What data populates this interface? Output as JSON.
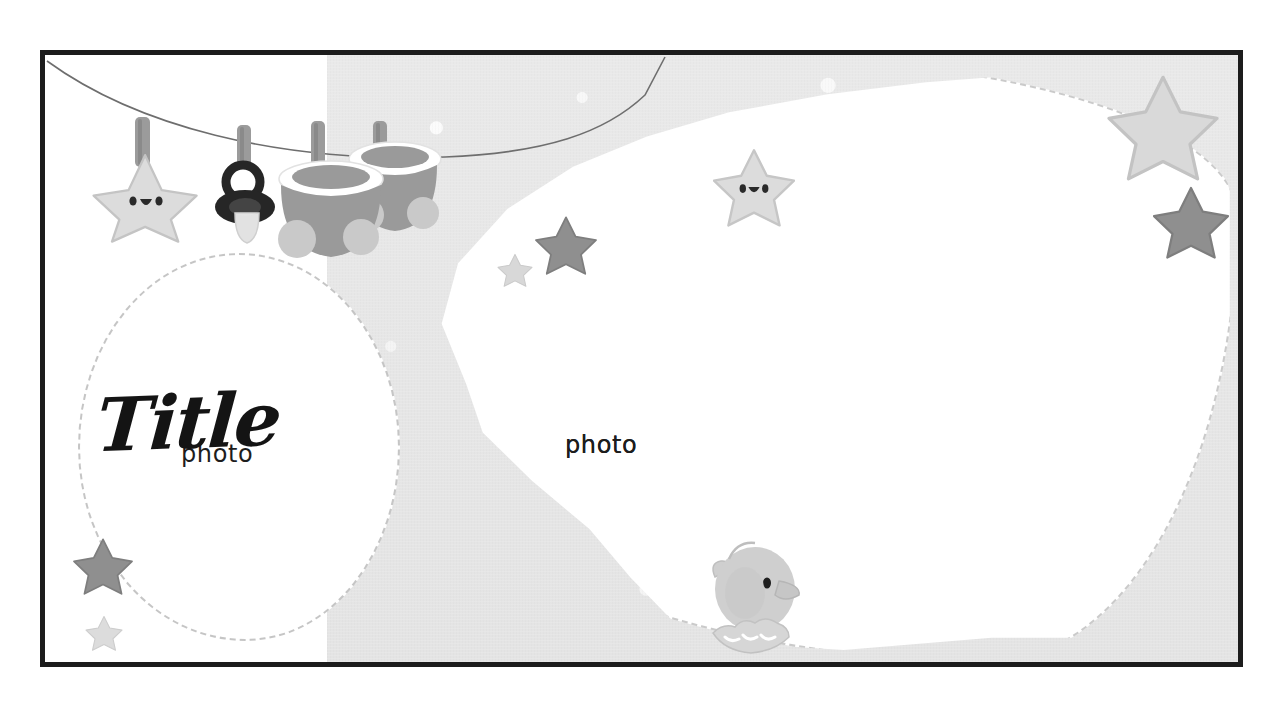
{
  "page": {
    "kind": "scrapbook-photo-collage-template",
    "theme": "baby",
    "title": "Title"
  },
  "colors": {
    "frame_border": "#1c1c1c",
    "panel_white": "#ffffff",
    "panel_grey": "#e7e7e7",
    "photo_fill": "#ffffff",
    "star_dark": "#8f8f8f",
    "star_mid": "#b4b4b4",
    "star_light": "#dedede",
    "bootie_grey": "#9a9a9a",
    "bootie_light": "#c9c9c9",
    "pacifier_dark": "#2b2b2b",
    "clothespin": "#9b9b9b",
    "line_color": "#6e6e6e",
    "text_color": "#1d1d1d",
    "duck_body": "#cfcfcf"
  },
  "photos": [
    {
      "id": "photo-1",
      "label": "photo",
      "shape": "circle"
    },
    {
      "id": "photo-2",
      "label": "photo",
      "shape": "organic-blob"
    },
    {
      "id": "photo-3",
      "label": "photo",
      "shape": "organic-blob"
    }
  ],
  "decorations": {
    "clothesline": {
      "name": "clothesline-string"
    },
    "hanging_items": [
      {
        "name": "star-plush-toy",
        "has_face": true
      },
      {
        "name": "pacifier"
      },
      {
        "name": "baby-bootie-left"
      },
      {
        "name": "baby-bootie-right"
      }
    ],
    "stars": [
      {
        "name": "star-mid-left",
        "tone": "dark"
      },
      {
        "name": "star-tiny-left",
        "tone": "light"
      },
      {
        "name": "star-face-center",
        "tone": "light",
        "has_face": true
      },
      {
        "name": "star-top-right-big",
        "tone": "light"
      },
      {
        "name": "star-top-right-dark",
        "tone": "dark"
      },
      {
        "name": "star-bottom-left",
        "tone": "dark"
      },
      {
        "name": "star-bottom-left-small",
        "tone": "light"
      }
    ],
    "duck": {
      "name": "rubber-duck",
      "tone": "light"
    }
  }
}
